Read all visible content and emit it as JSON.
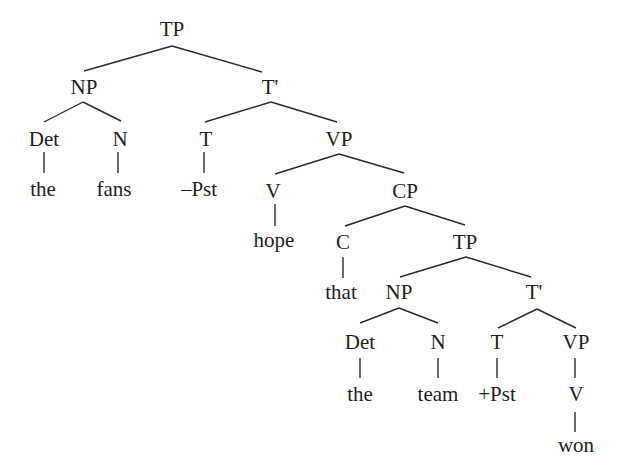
{
  "diagram": {
    "type": "syntax-tree",
    "sentence": "the fans –Pst hope that the team +Pst won",
    "nodes": [
      {
        "id": "tp1",
        "label": "TP",
        "x": 172,
        "y": 19
      },
      {
        "id": "np1",
        "label": "NP",
        "x": 84,
        "y": 77
      },
      {
        "id": "tbar1",
        "label": "T'",
        "x": 270,
        "y": 77
      },
      {
        "id": "det1",
        "label": "Det",
        "x": 44,
        "y": 129
      },
      {
        "id": "n1",
        "label": "N",
        "x": 120,
        "y": 129
      },
      {
        "id": "t1",
        "label": "T",
        "x": 206,
        "y": 129
      },
      {
        "id": "vp1",
        "label": "VP",
        "x": 339,
        "y": 129
      },
      {
        "id": "the1",
        "label": "the",
        "x": 43,
        "y": 179
      },
      {
        "id": "fans",
        "label": "fans",
        "x": 114,
        "y": 179
      },
      {
        "id": "npst",
        "label": "–Pst",
        "x": 199,
        "y": 179
      },
      {
        "id": "v1",
        "label": "V",
        "x": 273,
        "y": 181
      },
      {
        "id": "cp",
        "label": "CP",
        "x": 405,
        "y": 181
      },
      {
        "id": "hope",
        "label": "hope",
        "x": 274,
        "y": 230
      },
      {
        "id": "c",
        "label": "C",
        "x": 343,
        "y": 232
      },
      {
        "id": "tp2",
        "label": "TP",
        "x": 465,
        "y": 232
      },
      {
        "id": "that",
        "label": "that",
        "x": 341,
        "y": 282
      },
      {
        "id": "np2",
        "label": "NP",
        "x": 399,
        "y": 282
      },
      {
        "id": "tbar2",
        "label": "T'",
        "x": 534,
        "y": 282
      },
      {
        "id": "det2",
        "label": "Det",
        "x": 360,
        "y": 332
      },
      {
        "id": "n2",
        "label": "N",
        "x": 438,
        "y": 332
      },
      {
        "id": "t2",
        "label": "T",
        "x": 497,
        "y": 332
      },
      {
        "id": "vp2",
        "label": "VP",
        "x": 576,
        "y": 332
      },
      {
        "id": "the2",
        "label": "the",
        "x": 360,
        "y": 384
      },
      {
        "id": "team",
        "label": "team",
        "x": 438,
        "y": 384
      },
      {
        "id": "ppst",
        "label": "+Pst",
        "x": 497,
        "y": 384
      },
      {
        "id": "v2",
        "label": "V",
        "x": 576,
        "y": 384
      },
      {
        "id": "won",
        "label": "won",
        "x": 576,
        "y": 435
      }
    ],
    "edges": [
      {
        "from": "tp1",
        "to": "np1",
        "x1": 172,
        "y1": 46,
        "x2": 84,
        "y2": 71
      },
      {
        "from": "tp1",
        "to": "tbar1",
        "x1": 172,
        "y1": 46,
        "x2": 262,
        "y2": 72
      },
      {
        "from": "np1",
        "to": "det1",
        "x1": 83,
        "y1": 102,
        "x2": 44,
        "y2": 122
      },
      {
        "from": "np1",
        "to": "n1",
        "x1": 83,
        "y1": 102,
        "x2": 121,
        "y2": 121
      },
      {
        "from": "tbar1",
        "to": "t1",
        "x1": 271,
        "y1": 102,
        "x2": 205,
        "y2": 122
      },
      {
        "from": "tbar1",
        "to": "vp1",
        "x1": 271,
        "y1": 102,
        "x2": 337,
        "y2": 122
      },
      {
        "from": "det1",
        "to": "the1",
        "x1": 44,
        "y1": 152,
        "x2": 44,
        "y2": 173
      },
      {
        "from": "n1",
        "to": "fans",
        "x1": 118,
        "y1": 152,
        "x2": 118,
        "y2": 173
      },
      {
        "from": "t1",
        "to": "npst",
        "x1": 204,
        "y1": 152,
        "x2": 204,
        "y2": 173
      },
      {
        "from": "vp1",
        "to": "v1",
        "x1": 339,
        "y1": 154,
        "x2": 275,
        "y2": 174
      },
      {
        "from": "vp1",
        "to": "cp",
        "x1": 339,
        "y1": 154,
        "x2": 404,
        "y2": 173
      },
      {
        "from": "v1",
        "to": "hope",
        "x1": 275,
        "y1": 204,
        "x2": 275,
        "y2": 226
      },
      {
        "from": "cp",
        "to": "c",
        "x1": 405,
        "y1": 206,
        "x2": 345,
        "y2": 226
      },
      {
        "from": "cp",
        "to": "tp2",
        "x1": 405,
        "y1": 206,
        "x2": 465,
        "y2": 225
      },
      {
        "from": "c",
        "to": "that",
        "x1": 343,
        "y1": 257,
        "x2": 343,
        "y2": 278
      },
      {
        "from": "tp2",
        "to": "np2",
        "x1": 466,
        "y1": 257,
        "x2": 400,
        "y2": 277
      },
      {
        "from": "tp2",
        "to": "tbar2",
        "x1": 466,
        "y1": 257,
        "x2": 531,
        "y2": 277
      },
      {
        "from": "np2",
        "to": "det2",
        "x1": 399,
        "y1": 308,
        "x2": 360,
        "y2": 323
      },
      {
        "from": "np2",
        "to": "n2",
        "x1": 399,
        "y1": 308,
        "x2": 438,
        "y2": 323
      },
      {
        "from": "tbar2",
        "to": "t2",
        "x1": 537,
        "y1": 309,
        "x2": 498,
        "y2": 328
      },
      {
        "from": "tbar2",
        "to": "vp2",
        "x1": 537,
        "y1": 309,
        "x2": 576,
        "y2": 328
      },
      {
        "from": "det2",
        "to": "the2",
        "x1": 360,
        "y1": 358,
        "x2": 360,
        "y2": 378
      },
      {
        "from": "n2",
        "to": "team",
        "x1": 438,
        "y1": 358,
        "x2": 438,
        "y2": 378
      },
      {
        "from": "t2",
        "to": "ppst",
        "x1": 497,
        "y1": 358,
        "x2": 497,
        "y2": 378
      },
      {
        "from": "vp2",
        "to": "v2",
        "x1": 575,
        "y1": 358,
        "x2": 575,
        "y2": 378
      },
      {
        "from": "v2",
        "to": "won",
        "x1": 575,
        "y1": 412,
        "x2": 575,
        "y2": 432
      }
    ]
  }
}
